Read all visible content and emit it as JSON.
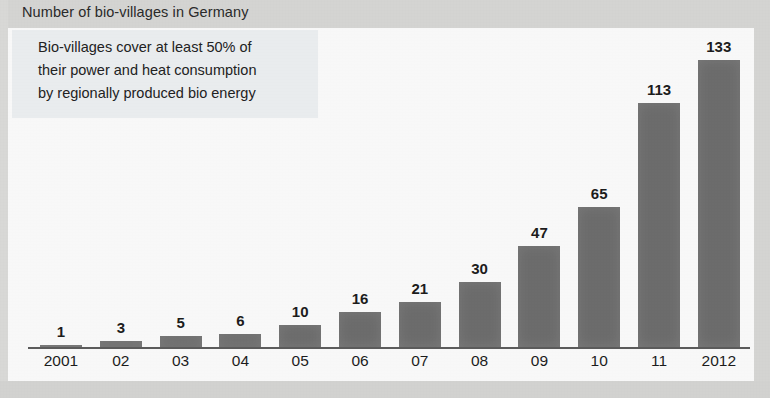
{
  "chart_data": {
    "type": "bar",
    "title": "Number of bio-villages in Germany",
    "annotation": "Bio-villages cover at least 50% of\ntheir power and heat consumption\nby regionally produced bio energy",
    "categories": [
      "2001",
      "02",
      "03",
      "04",
      "05",
      "06",
      "07",
      "08",
      "09",
      "10",
      "11",
      "2012"
    ],
    "values": [
      1,
      3,
      5,
      6,
      10,
      16,
      21,
      30,
      47,
      65,
      113,
      133
    ],
    "data_labels": [
      "1",
      "3",
      "5",
      "6",
      "10",
      "16",
      "21",
      "30",
      "47",
      "65",
      "113",
      "133"
    ],
    "xlabel": "",
    "ylabel": "",
    "ylim": [
      0,
      133
    ],
    "grid": false,
    "legend": false,
    "series": [
      {
        "name": "Number of bio-villages",
        "values": [
          1,
          3,
          5,
          6,
          10,
          16,
          21,
          30,
          47,
          65,
          113,
          133
        ]
      }
    ],
    "colors": {
      "bar_fill": "#6e6e6e",
      "axis": "#5d5d5d",
      "label_text": "#1d1d1d",
      "title_text": "#2b2b2b",
      "title_band": "#d8d8d6",
      "annotation_bg": "#eef1f3",
      "plot_bg": "#fdfdfd"
    }
  }
}
